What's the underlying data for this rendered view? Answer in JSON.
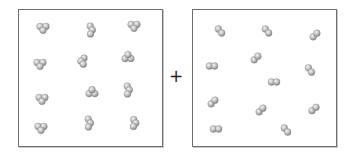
{
  "diagram": {
    "type": "chemical-reaction-particle-diagram",
    "operator": "+",
    "atom_color": "#b9b9b9",
    "atom_shade": "#7a7a7a",
    "atom_highlight": "#f2f2f2",
    "atom_radius": 3.4,
    "reactants": [
      {
        "name": "left-box",
        "molecule_type": "triatomic",
        "atoms_per_molecule": 3,
        "count": 12,
        "molecules": [
          {
            "x": 43,
            "y": 28,
            "shape": "tri-down"
          },
          {
            "x": 91,
            "y": 30,
            "shape": "tri-vertical"
          },
          {
            "x": 134,
            "y": 26,
            "shape": "tri-down"
          },
          {
            "x": 40,
            "y": 64,
            "shape": "tri-down"
          },
          {
            "x": 83,
            "y": 61,
            "shape": "tri-left"
          },
          {
            "x": 128,
            "y": 57,
            "shape": "tri-up"
          },
          {
            "x": 42,
            "y": 99,
            "shape": "tri-down"
          },
          {
            "x": 92,
            "y": 92,
            "shape": "tri-up"
          },
          {
            "x": 128,
            "y": 90,
            "shape": "tri-vertical"
          },
          {
            "x": 41,
            "y": 128,
            "shape": "tri-down"
          },
          {
            "x": 89,
            "y": 123,
            "shape": "tri-vertical"
          },
          {
            "x": 134,
            "y": 123,
            "shape": "tri-right"
          }
        ]
      },
      {
        "name": "right-box",
        "molecule_type": "diatomic",
        "atoms_per_molecule": 2,
        "count": 12,
        "molecules": [
          {
            "x": 220,
            "y": 31,
            "angle": 50
          },
          {
            "x": 267,
            "y": 31,
            "angle": 50
          },
          {
            "x": 315,
            "y": 35,
            "angle": -45
          },
          {
            "x": 212,
            "y": 66,
            "angle": 0
          },
          {
            "x": 256,
            "y": 58,
            "angle": -45
          },
          {
            "x": 310,
            "y": 70,
            "angle": 55
          },
          {
            "x": 274,
            "y": 82,
            "angle": 0
          },
          {
            "x": 213,
            "y": 102,
            "angle": -45
          },
          {
            "x": 261,
            "y": 110,
            "angle": -45
          },
          {
            "x": 314,
            "y": 109,
            "angle": -40
          },
          {
            "x": 216,
            "y": 129,
            "angle": 0
          },
          {
            "x": 286,
            "y": 130,
            "angle": 50
          }
        ]
      }
    ]
  }
}
